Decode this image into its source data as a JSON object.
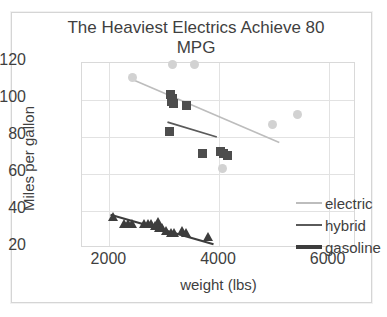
{
  "chart_data": {
    "type": "scatter",
    "title": "The Heaviest Electrics Achieve 80 MPG",
    "title_line1": "The Heaviest Electrics Achieve 80",
    "title_line2": "MPG",
    "xlabel": "weight (lbs)",
    "ylabel": "Miles per gallon",
    "xlim": [
      1500,
      6500
    ],
    "ylim": [
      20,
      120
    ],
    "xticks": [
      2000,
      4000,
      6000
    ],
    "yticks": [
      20,
      40,
      60,
      80,
      100,
      120
    ],
    "grid": true,
    "legend_position": "right-bottom",
    "colors": {
      "electric": "#d2d2d2",
      "hybrid": "#4d4d4d",
      "gasoline": "#3d3d3d",
      "electric_line": "#bdbdbd",
      "hybrid_line": "#5a5a5a",
      "gridline": "#e2e2e2",
      "text": "#3f3f3f"
    },
    "series": [
      {
        "name": "electric",
        "marker": "circle",
        "color": "#d2d2d2",
        "points": [
          {
            "x": 2430,
            "y": 112
          },
          {
            "x": 3160,
            "y": 119
          },
          {
            "x": 3560,
            "y": 119
          },
          {
            "x": 4060,
            "y": 63
          },
          {
            "x": 4980,
            "y": 87
          },
          {
            "x": 5440,
            "y": 92
          }
        ],
        "trendline": {
          "x1": 2430,
          "y1": 111,
          "x2": 5100,
          "y2": 77
        }
      },
      {
        "name": "hybrid",
        "marker": "square",
        "color": "#4d4d4d",
        "points": [
          {
            "x": 3120,
            "y": 103
          },
          {
            "x": 3150,
            "y": 101
          },
          {
            "x": 3140,
            "y": 99
          },
          {
            "x": 3170,
            "y": 98
          },
          {
            "x": 3400,
            "y": 97
          },
          {
            "x": 3100,
            "y": 83
          },
          {
            "x": 3700,
            "y": 71
          },
          {
            "x": 4020,
            "y": 72
          },
          {
            "x": 4080,
            "y": 71
          },
          {
            "x": 4150,
            "y": 70
          }
        ],
        "trendline": {
          "x1": 3060,
          "y1": 88,
          "x2": 3960,
          "y2": 80
        }
      },
      {
        "name": "gasoline",
        "marker": "triangle",
        "color": "#3d3d3d",
        "points": [
          {
            "x": 2060,
            "y": 37
          },
          {
            "x": 2260,
            "y": 33
          },
          {
            "x": 2340,
            "y": 33
          },
          {
            "x": 2420,
            "y": 33
          },
          {
            "x": 2630,
            "y": 33
          },
          {
            "x": 2700,
            "y": 33
          },
          {
            "x": 2760,
            "y": 33
          },
          {
            "x": 2840,
            "y": 32
          },
          {
            "x": 2880,
            "y": 34
          },
          {
            "x": 2900,
            "y": 31
          },
          {
            "x": 2960,
            "y": 31
          },
          {
            "x": 3040,
            "y": 29
          },
          {
            "x": 3120,
            "y": 28
          },
          {
            "x": 3180,
            "y": 28
          },
          {
            "x": 3320,
            "y": 29
          },
          {
            "x": 3400,
            "y": 28
          },
          {
            "x": 3800,
            "y": 26
          }
        ],
        "trendline": {
          "x1": 2020,
          "y1": 38,
          "x2": 3900,
          "y2": 22
        }
      }
    ]
  },
  "legend": {
    "items": [
      {
        "label": "electric"
      },
      {
        "label": "hybrid"
      },
      {
        "label": "gasoline"
      }
    ]
  }
}
